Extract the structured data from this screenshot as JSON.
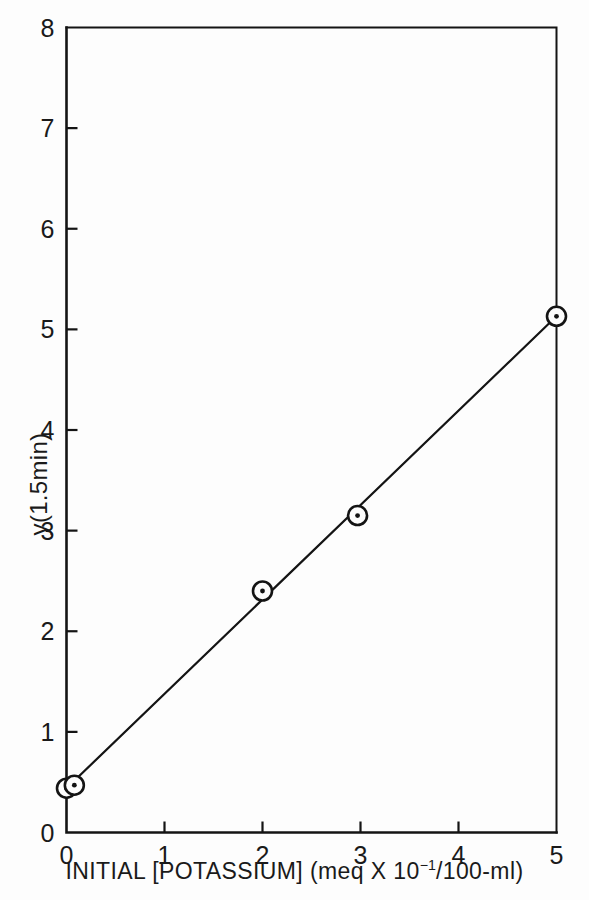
{
  "chart_data": {
    "type": "scatter",
    "title": "",
    "xlabel": "INITIAL [POTASSIUM] (meq X 10⁻¹/100-ml)",
    "ylabel": "y(1.5min)",
    "xlim": [
      0,
      5
    ],
    "ylim": [
      0,
      8
    ],
    "grid": false,
    "legend": null,
    "xticks": [
      0,
      1,
      2,
      3,
      4,
      5
    ],
    "yticks": [
      0,
      1,
      2,
      3,
      4,
      5,
      6,
      7,
      8
    ],
    "xtick_labels": [
      "0",
      "1",
      "2",
      "3",
      "4",
      "5"
    ],
    "ytick_labels": [
      "0",
      "1",
      "2",
      "3",
      "4",
      "5",
      "6",
      "7",
      "8"
    ],
    "marker": "circle-with-center-dot",
    "points": [
      {
        "x": 0.0,
        "y": 0.44
      },
      {
        "x": 0.08,
        "y": 0.47
      },
      {
        "x": 2.0,
        "y": 2.4
      },
      {
        "x": 2.97,
        "y": 3.15
      },
      {
        "x": 5.0,
        "y": 5.13
      }
    ],
    "fit_line": {
      "type": "line",
      "x": [
        0.0,
        5.0
      ],
      "y": [
        0.44,
        5.13
      ],
      "slope": 0.938,
      "intercept": 0.44
    }
  },
  "axis": {
    "x_title_main": "INITIAL [POTASSIUM] (meq X 10",
    "x_title_exp": "−1",
    "x_title_tail": "/100-ml)",
    "y_title": "y(1.5min)"
  },
  "style": {
    "ink": "#141414",
    "background": "#fdfdfd",
    "axis_width": 2.6,
    "line_width": 2.2,
    "marker_radius": 9.5
  }
}
